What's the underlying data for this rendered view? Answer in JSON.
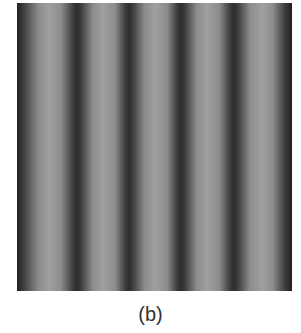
{
  "figure": {
    "caption": "(b)",
    "image": {
      "description": "vertical sinusoidal grayscale fringe pattern",
      "stripe_orientation": "vertical",
      "dark_color": "#2a2a2a",
      "light_color": "#a2a2a2"
    }
  }
}
